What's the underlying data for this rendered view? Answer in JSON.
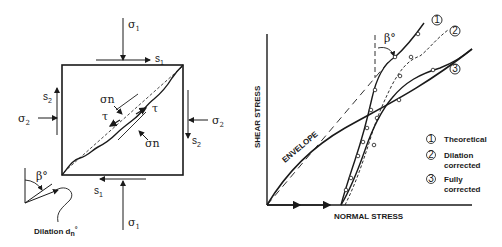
{
  "specimen": {
    "sigma1_top": "σ",
    "sigma1_top_sub": "1",
    "sigma1_bottom": "σ",
    "sigma1_bottom_sub": "1",
    "sigma2_left": "σ",
    "sigma2_left_sub": "2",
    "sigma2_right": "σ",
    "sigma2_right_sub": "2",
    "s1_top": "s",
    "s1_top_sub": "1",
    "s1_bottom": "s",
    "s1_bottom_sub": "1",
    "s2_left": "s",
    "s2_left_sub": "2",
    "s2_right": "s",
    "s2_right_sub": "2",
    "sigma_n_upper": "σn",
    "sigma_n_lower": "σn",
    "tau_left": "τ",
    "tau_right": "τ",
    "beta": "β°",
    "dilation_label": "Dilation d",
    "dilation_sub": "n",
    "dilation_sup": "°"
  },
  "graph": {
    "ylabel": "SHEAR STRESS",
    "xlabel": "NORMAL STRESS",
    "envelope_label": "ENVELOPE",
    "beta": "β°",
    "curve_markers": [
      "1",
      "2",
      "3"
    ],
    "legend": [
      {
        "num": "1",
        "label": "Theoretical"
      },
      {
        "num": "2",
        "label": "Dilation",
        "label2": "corrected"
      },
      {
        "num": "3",
        "label": "Fully",
        "label2": "corrected"
      }
    ]
  },
  "colors": {
    "ink": "#1a1a1a",
    "background": "#ffffff"
  }
}
